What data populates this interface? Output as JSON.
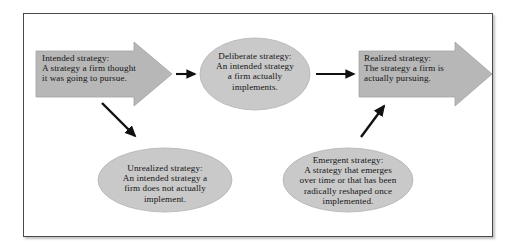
{
  "diagram": {
    "colors": {
      "arrow_fill": "#b7b7b7",
      "arrow_stroke": "#9a9a9a",
      "ellipse_fill": "#c9c9c9",
      "ellipse_stroke": "#b0b0b0",
      "connector": "#111111",
      "frame_border": "#4a4a4a",
      "background": "#ffffff",
      "text": "#141414"
    },
    "nodes": {
      "intended": {
        "shape": "block-arrow",
        "heading": "Intended strategy:",
        "line2": "A strategy a firm thought",
        "line3": "it was going to pursue."
      },
      "deliberate": {
        "shape": "ellipse",
        "heading": "Deliberate strategy:",
        "line2": "An intended strategy",
        "line3": "a firm actually",
        "line4": "implements."
      },
      "realized": {
        "shape": "block-arrow",
        "heading": "Realized strategy:",
        "line2": "The strategy a firm is",
        "line3": "actually pursuing."
      },
      "unrealized": {
        "shape": "ellipse",
        "heading": "Unrealized strategy:",
        "line2": "An intended strategy a",
        "line3": "firm does not actually",
        "line4": "implement."
      },
      "emergent": {
        "shape": "ellipse",
        "heading": "Emergent strategy:",
        "line2": "A strategy that emerges",
        "line3": "over time or that has been",
        "line4": "radically reshaped once",
        "line5": "implemented."
      }
    },
    "connectors": [
      {
        "name": "intended-to-deliberate",
        "style": "horizontal-right-arrow"
      },
      {
        "name": "deliberate-to-realized",
        "style": "horizontal-right-arrow"
      },
      {
        "name": "intended-to-unrealized",
        "style": "diagonal-down-right-arrow"
      },
      {
        "name": "emergent-to-realized",
        "style": "diagonal-up-right-arrow"
      }
    ]
  }
}
